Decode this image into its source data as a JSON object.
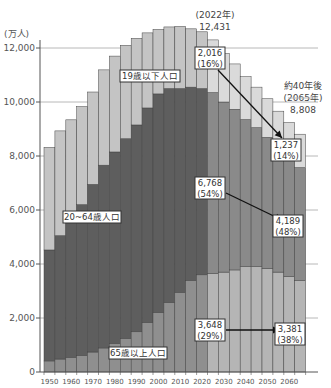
{
  "chart_data": {
    "type": "bar",
    "stacked": true,
    "title": "",
    "ylabel": "(万人)",
    "xlabel": "",
    "ylim": [
      0,
      12800
    ],
    "yticks": [
      0,
      2000,
      4000,
      6000,
      8000,
      10000,
      12000
    ],
    "ytick_labels": [
      "0",
      "2,000",
      "4,000",
      "6,000",
      "8,000",
      "10,000",
      "12,000"
    ],
    "xtick_labels": [
      "1950",
      "1960",
      "1970",
      "1980",
      "1990",
      "2000",
      "2010",
      "2020",
      "2030",
      "2040",
      "2050",
      "2060"
    ],
    "grid": "horizontal at 2,000-unit ticks (right side beyond bars)",
    "categories": [
      "1950",
      "1955",
      "1960",
      "1965",
      "1970",
      "1975",
      "1980",
      "1985",
      "1990",
      "1995",
      "2000",
      "2005",
      "2010",
      "2015",
      "2020",
      "2025",
      "2030",
      "2035",
      "2040",
      "2045",
      "2050",
      "2055",
      "2060",
      "2065"
    ],
    "series": [
      {
        "name": "65歳以上人口",
        "color": "#8f8f8f",
        "values": [
          410,
          480,
          540,
          620,
          740,
          890,
          1060,
          1250,
          1490,
          1830,
          2200,
          2570,
          2950,
          3390,
          3600,
          3650,
          3700,
          3780,
          3900,
          3900,
          3840,
          3700,
          3540,
          3381
        ]
      },
      {
        "name": "20~64歳人口",
        "color": "#5e5e5e",
        "values": [
          4110,
          4570,
          5040,
          5580,
          6210,
          6770,
          7090,
          7390,
          7660,
          7950,
          8100,
          7930,
          7550,
          7160,
          6900,
          6700,
          6300,
          5950,
          5450,
          5150,
          4850,
          4600,
          4400,
          4189
        ]
      },
      {
        "name": "19歳以下人口",
        "color": "#c4c4c4",
        "values": [
          3800,
          3880,
          3760,
          3630,
          3420,
          3530,
          3550,
          3460,
          3210,
          2780,
          2390,
          2280,
          2300,
          2160,
          2100,
          1950,
          1800,
          1680,
          1590,
          1500,
          1430,
          1360,
          1300,
          1237
        ]
      }
    ],
    "future_from": "2025",
    "future_colors": {
      "65歳以上人口": "#b5b5b5",
      "20~64歳人口": "#8a8a8a",
      "19歳以下人口": "#dadada"
    },
    "annotations": {
      "peak": {
        "year_label": "(2022年)",
        "total": "12,431"
      },
      "future": {
        "line1": "約40年後",
        "line2": "(2065年)",
        "total": "8,808"
      },
      "under19_2022": {
        "value": "2,016",
        "pct": "(16%)"
      },
      "under19_2065": {
        "value": "1,237",
        "pct": "(14%)"
      },
      "mid_2022": {
        "value": "6,768",
        "pct": "(54%)"
      },
      "mid_2065": {
        "value": "4,189",
        "pct": "(48%)"
      },
      "old_2022": {
        "value": "3,648",
        "pct": "(29%)"
      },
      "old_2065": {
        "value": "3,381",
        "pct": "(38%)"
      }
    },
    "series_labels": {
      "under19": "19歳以下人口",
      "mid": "20~64歳人口",
      "old": "65歳以上人口"
    }
  }
}
